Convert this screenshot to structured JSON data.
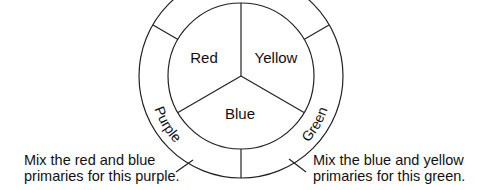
{
  "diagram": {
    "primaries": [
      {
        "label": "Red"
      },
      {
        "label": "Yellow"
      },
      {
        "label": "Blue"
      }
    ],
    "secondaries": [
      {
        "label": "Purple"
      },
      {
        "label": "Green"
      }
    ],
    "captions": {
      "purple": {
        "line1": "Mix the red and blue",
        "line2": "primaries for this purple."
      },
      "green": {
        "line1": "Mix the blue and yellow",
        "line2": "primaries for this green."
      }
    },
    "colors": {
      "stroke": "#222222",
      "background": "#ffffff"
    }
  }
}
